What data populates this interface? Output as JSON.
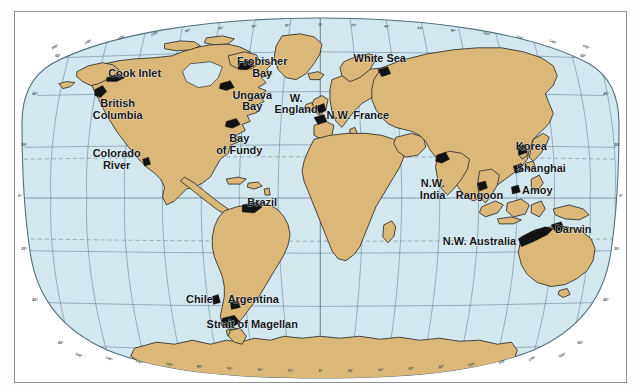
{
  "figure": {
    "type": "world-map",
    "projection": "oval (Van der Grinten style) world map",
    "frame_border_color": "#8e9193",
    "background_color": "#ffffff"
  },
  "colors": {
    "ocean": "#d3e7ef",
    "land": "#dcb878",
    "coastline": "#2a2a2a",
    "graticule": "#4a6b7c",
    "graticule_dashed": "#4a6b7c",
    "highlight_black": "#121212",
    "label_text": "#13161a",
    "frame": "#8e9193"
  },
  "graticule": {
    "longitude_interval_deg": 20,
    "latitude_interval_deg": 20,
    "top_longitude_labels": [
      "160°",
      "140°",
      "120°",
      "100°",
      "80°",
      "60°",
      "40°",
      "20°",
      "0°",
      "20°",
      "40°",
      "60°",
      "80°",
      "100°",
      "120°",
      "140°",
      "160°"
    ],
    "bottom_longitude_labels": [
      "160°",
      "140°",
      "120°",
      "100°",
      "80°",
      "60°",
      "40°",
      "20°",
      "0°",
      "20°",
      "40°",
      "60°",
      "80°",
      "100°",
      "120°",
      "140°",
      "160°"
    ],
    "left_latitude_labels": [
      "60°",
      "40°",
      "20°",
      "0°",
      "20°",
      "40°",
      "60°"
    ],
    "right_latitude_labels": [
      "60°",
      "40°",
      "20°",
      "0°",
      "20°",
      "40°",
      "60°"
    ],
    "dashed_latitudes": [
      "23.5° N (Tropic of Cancer)",
      "23.5° S (Tropic of Capricorn)"
    ]
  },
  "place_labels": [
    {
      "id": "cook-inlet",
      "text": "Cook Inlet",
      "x": 120,
      "y": 65,
      "anchor": "middle",
      "lines": [
        "Cook Inlet"
      ]
    },
    {
      "id": "british-columbia",
      "text": "British Columbia",
      "x": 103,
      "y": 96,
      "anchor": "middle",
      "lines": [
        "British",
        "Columbia"
      ]
    },
    {
      "id": "colorado-river",
      "text": "Colorado River",
      "x": 102,
      "y": 146,
      "anchor": "middle",
      "lines": [
        "Colorado",
        "River"
      ]
    },
    {
      "id": "frobisher-bay",
      "text": "Frobisher Bay",
      "x": 248,
      "y": 53,
      "anchor": "middle",
      "lines": [
        "Frobisher",
        "Bay"
      ]
    },
    {
      "id": "ungava-bay",
      "text": "Ungava Bay",
      "x": 238,
      "y": 87,
      "anchor": "middle",
      "lines": [
        "Ungava",
        "Bay"
      ]
    },
    {
      "id": "bay-of-fundy",
      "text": "Bay of Fundy",
      "x": 225,
      "y": 131,
      "anchor": "middle",
      "lines": [
        "Bay",
        "of Fundy"
      ]
    },
    {
      "id": "w-england",
      "text": "W. England",
      "x": 282,
      "y": 90,
      "anchor": "middle",
      "lines": [
        "W.",
        "England"
      ]
    },
    {
      "id": "nw-france",
      "text": "N.W. France",
      "x": 344,
      "y": 108,
      "anchor": "middle",
      "lines": [
        "N.W. France"
      ]
    },
    {
      "id": "white-sea",
      "text": "White Sea",
      "x": 366,
      "y": 50,
      "anchor": "middle",
      "lines": [
        "White Sea"
      ]
    },
    {
      "id": "korea",
      "text": "Korea",
      "x": 518,
      "y": 139,
      "anchor": "middle",
      "lines": [
        "Korea"
      ]
    },
    {
      "id": "shanghai",
      "text": "Shanghai",
      "x": 528,
      "y": 161,
      "anchor": "middle",
      "lines": [
        "Shanghai"
      ]
    },
    {
      "id": "amoy",
      "text": "Amoy",
      "x": 524,
      "y": 183,
      "anchor": "middle",
      "lines": [
        "Amoy"
      ]
    },
    {
      "id": "nw-india",
      "text": "N.W. India",
      "x": 419,
      "y": 176,
      "anchor": "middle",
      "lines": [
        "N.W.",
        "India"
      ]
    },
    {
      "id": "rangoon",
      "text": "Rangoon",
      "x": 466,
      "y": 188,
      "anchor": "middle",
      "lines": [
        "Rangoon"
      ]
    },
    {
      "id": "nw-australia",
      "text": "N.W. Australia",
      "x": 466,
      "y": 234,
      "anchor": "middle",
      "lines": [
        "N.W. Australia"
      ]
    },
    {
      "id": "darwin",
      "text": "Darwin",
      "x": 560,
      "y": 222,
      "anchor": "middle",
      "lines": [
        "Darwin"
      ]
    },
    {
      "id": "brazil",
      "text": "Brazil",
      "x": 248,
      "y": 195,
      "anchor": "middle",
      "lines": [
        "Brazil"
      ]
    },
    {
      "id": "chile",
      "text": "Chile",
      "x": 185,
      "y": 293,
      "anchor": "middle",
      "lines": [
        "Chile"
      ]
    },
    {
      "id": "argentina",
      "text": "Argentina",
      "x": 239,
      "y": 293,
      "anchor": "middle",
      "lines": [
        "Argentina"
      ]
    },
    {
      "id": "strait-of-magellan",
      "text": "Strait of Magellan",
      "x": 238,
      "y": 318,
      "anchor": "middle",
      "lines": [
        "Strait of Magellan"
      ]
    }
  ],
  "highlighted_coasts": [
    "Cook Inlet",
    "British Columbia",
    "Colorado River",
    "Frobisher Bay",
    "Ungava Bay",
    "Bay of Fundy",
    "W. England",
    "N.W. France",
    "White Sea",
    "Korea",
    "Shanghai",
    "Amoy",
    "N.W. India",
    "Rangoon",
    "N.W. Australia",
    "Darwin",
    "Brazil",
    "Chile",
    "Argentina",
    "Strait of Magellan"
  ],
  "continents": [
    "North America",
    "South America",
    "Greenland",
    "Europe",
    "Africa",
    "Asia",
    "Australia",
    "Antarctica",
    "New Zealand",
    "Madagascar",
    "Japan",
    "Indonesia",
    "British Isles",
    "Iceland"
  ]
}
